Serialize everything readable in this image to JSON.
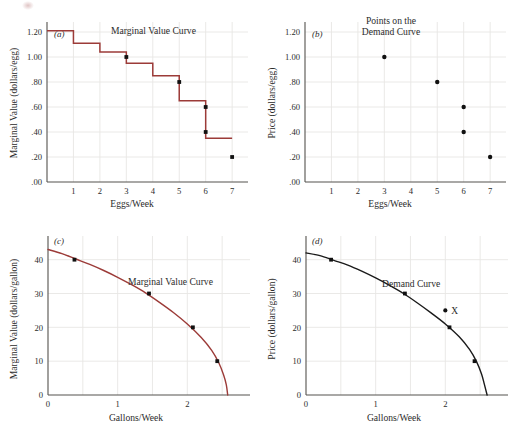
{
  "figure": {
    "panel_count": 4,
    "colors": {
      "marginal_value_curve": "#9c3b38",
      "demand_curve": "#1a1a1a",
      "axis": "#55524e",
      "grid": "#e8e6e4",
      "point": "#111111",
      "background": "#ffffff"
    }
  },
  "chart_data": [
    {
      "type": "line",
      "panel": "a",
      "panel_label": "(a)",
      "title": "Marginal Value Curve",
      "annotation": "Marginal Value Curve",
      "xlabel": "Eggs/Week",
      "ylabel": "Marginal Value (dollars/egg)",
      "xlim": [
        0,
        7.6
      ],
      "ylim": [
        0,
        1.28
      ],
      "xticks": [
        1,
        2,
        3,
        4,
        5,
        6,
        7
      ],
      "xticklabels": [
        "1",
        "2",
        "3",
        "4",
        "5",
        "6",
        "7"
      ],
      "yticks": [
        0.0,
        0.2,
        0.4,
        0.6,
        0.8,
        1.0,
        1.2
      ],
      "yticklabels": [
        ".00",
        ".20",
        ".40",
        ".60",
        ".80",
        "1.00",
        "1.20"
      ],
      "grid": true,
      "step_style": "post",
      "categories": [
        "1",
        "2",
        "3",
        "4",
        "5",
        "6",
        "7"
      ],
      "values": [
        1.21,
        1.11,
        1.04,
        0.95,
        0.85,
        0.65,
        0.35
      ],
      "marked_points": [
        {
          "x": 3,
          "y": 1.0
        },
        {
          "x": 5,
          "y": 0.8
        },
        {
          "x": 6,
          "y": 0.6
        },
        {
          "x": 6,
          "y": 0.4
        },
        {
          "x": 7,
          "y": 0.2
        }
      ]
    },
    {
      "type": "scatter",
      "panel": "b",
      "panel_label": "(b)",
      "title": "Points on the Demand Curve",
      "annotation_line1": "Points on the",
      "annotation_line2": "Demand Curve",
      "xlabel": "Eggs/Week",
      "ylabel": "Price (dollars/egg)",
      "xlim": [
        0,
        7.6
      ],
      "ylim": [
        0,
        1.28
      ],
      "xticks": [
        1,
        2,
        3,
        4,
        5,
        6,
        7
      ],
      "xticklabels": [
        "1",
        "2",
        "3",
        "4",
        "5",
        "6",
        "7"
      ],
      "yticks": [
        0.0,
        0.2,
        0.4,
        0.6,
        0.8,
        1.0,
        1.2
      ],
      "yticklabels": [
        ".00",
        ".20",
        ".40",
        ".60",
        ".80",
        "1.00",
        "1.20"
      ],
      "grid": true,
      "points": [
        {
          "x": 3,
          "y": 1.0
        },
        {
          "x": 5,
          "y": 0.8
        },
        {
          "x": 6,
          "y": 0.6
        },
        {
          "x": 6,
          "y": 0.4
        },
        {
          "x": 7,
          "y": 0.2
        }
      ]
    },
    {
      "type": "line",
      "panel": "c",
      "panel_label": "(c)",
      "title": "Marginal Value Curve",
      "annotation": "Marginal Value Curve",
      "xlabel": "Gallons/Week",
      "ylabel": "Marginal Value (dollars/gallon)",
      "xlim": [
        0,
        2.9
      ],
      "ylim": [
        0,
        47
      ],
      "xticks": [
        0,
        1,
        2
      ],
      "xticklabels": [
        "0",
        "1",
        "2"
      ],
      "yticks": [
        0,
        10,
        20,
        30,
        40
      ],
      "yticklabels": [
        "0",
        "10",
        "20",
        "30",
        "40"
      ],
      "grid": true,
      "curve_x": [
        0.0,
        0.2,
        0.4,
        0.6,
        0.8,
        1.0,
        1.2,
        1.4,
        1.6,
        1.8,
        2.0,
        2.2,
        2.35,
        2.45,
        2.52,
        2.56,
        2.58
      ],
      "curve_y": [
        43.0,
        41.8,
        40.2,
        38.6,
        36.8,
        34.8,
        32.6,
        30.2,
        27.4,
        24.4,
        21.0,
        17.0,
        13.2,
        9.6,
        6.0,
        3.0,
        0.0
      ],
      "marked_points": [
        {
          "x": 0.38,
          "y": 40.0
        },
        {
          "x": 1.45,
          "y": 30.0
        },
        {
          "x": 2.08,
          "y": 20.0
        },
        {
          "x": 2.43,
          "y": 10.0
        }
      ]
    },
    {
      "type": "line",
      "panel": "d",
      "panel_label": "(d)",
      "title": "Demand Curve",
      "annotation": "Demand Curve",
      "xlabel": "Gallons/Week",
      "ylabel": "Price (dollars/gallon)",
      "xlim": [
        0,
        2.9
      ],
      "ylim": [
        0,
        47
      ],
      "xticks": [
        0,
        1,
        2
      ],
      "xticklabels": [
        "0",
        "1",
        "2"
      ],
      "yticks": [
        0,
        10,
        20,
        30,
        40
      ],
      "yticklabels": [
        "0",
        "10",
        "20",
        "30",
        "40"
      ],
      "grid": true,
      "curve_x": [
        0.0,
        0.2,
        0.4,
        0.6,
        0.8,
        1.0,
        1.2,
        1.4,
        1.6,
        1.8,
        2.0,
        2.2,
        2.35,
        2.45,
        2.52,
        2.56,
        2.6
      ],
      "curve_y": [
        42.0,
        41.2,
        39.8,
        38.4,
        36.6,
        34.6,
        32.4,
        30.0,
        27.2,
        24.2,
        21.0,
        17.2,
        13.4,
        9.8,
        6.2,
        3.2,
        0.0
      ],
      "marked_points": [
        {
          "x": 0.36,
          "y": 40.0
        },
        {
          "x": 1.42,
          "y": 30.0
        },
        {
          "x": 2.06,
          "y": 20.0
        },
        {
          "x": 2.42,
          "y": 10.0
        }
      ],
      "labeled_point": {
        "x": 2.0,
        "y": 25.0,
        "label": "X"
      }
    }
  ]
}
